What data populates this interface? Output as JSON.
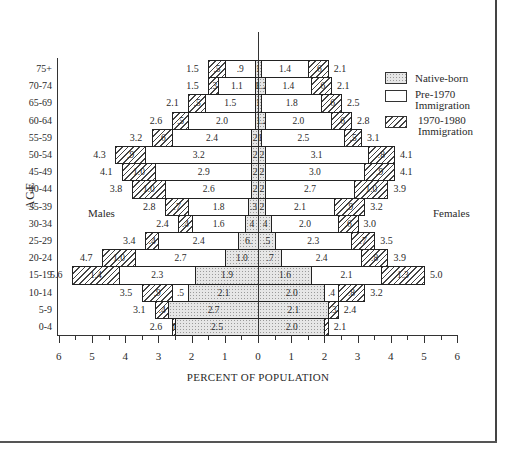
{
  "chart_data": {
    "type": "bar",
    "subtype": "population-pyramid-stacked",
    "title": "",
    "xlabel": "PERCENT OF POPULATION",
    "ylabel": "AGE",
    "xlim": [
      -6,
      6
    ],
    "x_ticks": [
      "6",
      "5",
      "4",
      "3",
      "2",
      "1",
      "0",
      "1",
      "2",
      "3",
      "4",
      "5",
      "6"
    ],
    "side_labels": {
      "left": "Males",
      "right": "Females"
    },
    "legend": [
      {
        "key": "native",
        "label": "Native-born",
        "pattern": "dotted"
      },
      {
        "key": "pre1970",
        "label": "Pre-1970 Immigration",
        "pattern": "blank"
      },
      {
        "key": "recent",
        "label": "1970-1980 Immigration",
        "pattern": "hatched"
      }
    ],
    "categories": [
      "75+",
      "70-74",
      "65-69",
      "60-64",
      "55-59",
      "50-54",
      "45-49",
      "40-44",
      "35-39",
      "30-34",
      "25-29",
      "20-24",
      "15-19",
      "10-14",
      "5-9",
      "0-4"
    ],
    "males": {
      "native": [
        0.1,
        0.1,
        0.1,
        0.1,
        0.2,
        0.2,
        0.2,
        0.2,
        0.3,
        0.4,
        0.6,
        1.0,
        1.9,
        2.1,
        2.7,
        2.5
      ],
      "pre1970": [
        0.9,
        1.1,
        1.5,
        2.0,
        2.4,
        3.2,
        2.9,
        2.6,
        1.8,
        1.6,
        2.4,
        2.7,
        2.3,
        0.5,
        0.0,
        0.0
      ],
      "recent": [
        0.5,
        0.3,
        0.5,
        0.5,
        0.6,
        0.9,
        1.0,
        1.0,
        0.7,
        0.4,
        0.4,
        1.0,
        1.4,
        0.9,
        0.4,
        0.1
      ],
      "total": [
        1.5,
        1.5,
        2.1,
        2.6,
        3.2,
        4.3,
        4.1,
        3.8,
        2.8,
        2.4,
        3.4,
        4.7,
        5.6,
        3.5,
        3.1,
        2.6
      ]
    },
    "females": {
      "native": [
        0.1,
        0.2,
        0.1,
        0.2,
        0.1,
        0.2,
        0.2,
        0.2,
        0.2,
        0.4,
        0.5,
        0.7,
        1.6,
        2.0,
        2.1,
        2.0
      ],
      "pre1970": [
        1.4,
        1.4,
        1.8,
        2.0,
        2.5,
        3.1,
        3.0,
        2.7,
        2.1,
        2.0,
        2.3,
        2.4,
        2.1,
        0.4,
        0.0,
        0.0
      ],
      "recent": [
        0.6,
        0.6,
        0.6,
        0.6,
        0.5,
        0.8,
        0.9,
        1.0,
        0.9,
        0.6,
        0.7,
        0.8,
        1.3,
        0.8,
        0.3,
        0.1
      ],
      "total": [
        2.1,
        2.1,
        2.5,
        2.8,
        3.1,
        4.1,
        4.1,
        3.9,
        3.2,
        3.0,
        3.5,
        3.9,
        5.0,
        3.2,
        2.4,
        2.1
      ]
    },
    "labels": {
      "males": {
        "native": [
          ".1",
          "1",
          ".1",
          "",
          "2",
          "2",
          "2",
          "2",
          ".3",
          "4",
          "6.",
          "1.0",
          "1.9",
          "2.1",
          "2.7",
          "2.5"
        ],
        "pre1970": [
          ".9",
          "1.1",
          "1.5",
          "2.0",
          "2.4",
          "3.2",
          "2.9",
          "2.6",
          "1.8",
          "1.6",
          "2.4",
          "2.7",
          "2.3",
          ".5",
          "",
          ""
        ],
        "recent": [
          ".5",
          ".3",
          ".5",
          ".5",
          ".6",
          ".9",
          "1.0",
          "1.0",
          ".7",
          ".4",
          ".4",
          "1.0",
          "1.4",
          ".9",
          ".4",
          "1"
        ]
      },
      "females": {
        "native": [
          "",
          "1.2",
          "",
          "1.2",
          "1",
          "2",
          "2",
          "2",
          "2",
          "4",
          ".5",
          ".7",
          "1.6",
          "2.0",
          "2.1",
          "2.0"
        ],
        "pre1970": [
          "1.4",
          "1.4",
          "1.8",
          "2.0",
          "2.5",
          "3.1",
          "3.0",
          "2.7",
          "2.1",
          "2.0",
          "2.3",
          "2.4",
          "2.1",
          ".4",
          "",
          ""
        ],
        "recent": [
          ".6",
          ".6",
          ".6",
          ".6",
          ".5",
          ".8",
          ".9",
          "1.0",
          ".9",
          ".6",
          ".7",
          ".8",
          "1.3",
          ".8",
          ".3",
          ""
        ]
      }
    }
  }
}
